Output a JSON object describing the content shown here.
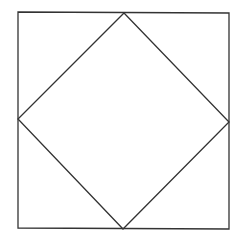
{
  "diagram": {
    "background": "#ffffff",
    "stroke_color": "#333333",
    "stroke_width": 1.3,
    "outer_square": {
      "points": [
        [
          18,
          12
        ],
        [
          229,
          13
        ],
        [
          229,
          229
        ],
        [
          18,
          228
        ]
      ]
    },
    "inner_diamond": {
      "points": [
        [
          124,
          13
        ],
        [
          229,
          122
        ],
        [
          123,
          229
        ],
        [
          18,
          119
        ]
      ]
    }
  }
}
